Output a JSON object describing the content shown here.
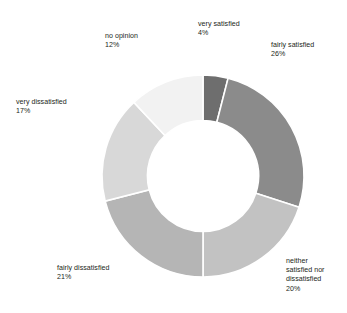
{
  "chart_data": {
    "type": "pie",
    "variant": "donut",
    "title": "",
    "xlabel": "",
    "ylabel": "",
    "units": "percent",
    "total": 100,
    "legend_position": "none",
    "labels_outside": true,
    "start_angle_deg": 0,
    "direction": "clockwise",
    "inner_radius_ratio": 0.55,
    "categories": [
      "very satisfied",
      "fairly satisfied",
      "neither satisfied nor dissatisfied",
      "fairly dissatisfied",
      "very dissatisfied",
      "no opinion"
    ],
    "values": [
      4,
      26,
      20,
      21,
      17,
      12
    ],
    "value_labels": [
      "4%",
      "26%",
      "20%",
      "21%",
      "17%",
      "12%"
    ],
    "colors": [
      "#6e6e6e",
      "#8b8b8b",
      "#c2c2c2",
      "#b5b5b5",
      "#d8d8d8",
      "#f2f2f2"
    ],
    "slice_separator_color": "#ffffff"
  },
  "chart": {
    "cut_off_title": "",
    "slices": [
      {
        "id": "very-satisfied",
        "name": "very satisfied",
        "pct": "4%",
        "value": 4,
        "color": "#6e6e6e",
        "label_line1": "very satisfied",
        "label_line2": "4%"
      },
      {
        "id": "fairly-satisfied",
        "name": "fairly satisfied",
        "pct": "26%",
        "value": 26,
        "color": "#8b8b8b",
        "label_line1": "fairly satisfied",
        "label_line2": "26%"
      },
      {
        "id": "neither",
        "name": "neither satisfied nor dissatisfied",
        "pct": "20%",
        "value": 20,
        "color": "#c2c2c2",
        "label_line1": "neither",
        "label_line2": "satisfied nor",
        "label_line3": "dissatisfied",
        "label_line4": "20%"
      },
      {
        "id": "fairly-dissatisfied",
        "name": "fairly dissatisfied",
        "pct": "21%",
        "value": 21,
        "color": "#b5b5b5",
        "label_line1": "fairly dissatisfied",
        "label_line2": "21%"
      },
      {
        "id": "very-dissatisfied",
        "name": "very dissatisfied",
        "pct": "17%",
        "value": 17,
        "color": "#d8d8d8",
        "label_line1": "very dissatisfied",
        "label_line2": "17%"
      },
      {
        "id": "no-opinion",
        "name": "no opinion",
        "pct": "12%",
        "value": 12,
        "color": "#f2f2f2",
        "label_line1": "no opinion",
        "label_line2": "12%"
      }
    ]
  }
}
